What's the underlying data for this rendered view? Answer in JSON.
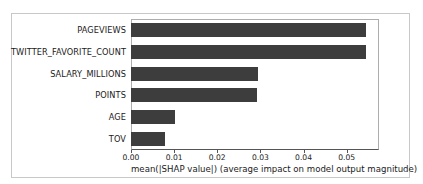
{
  "chart_data": {
    "type": "bar",
    "orientation": "horizontal",
    "title": "",
    "xlabel": "mean(|SHAP value|) (average impact on model output magnitude)",
    "ylabel": "",
    "categories": [
      "PAGEVIEWS",
      "TWITTER_FAVORITE_COUNT",
      "SALARY_MILLIONS",
      "POINTS",
      "AGE",
      "TOV"
    ],
    "values": [
      0.0545,
      0.0545,
      0.0294,
      0.0292,
      0.0103,
      0.0078
    ],
    "xlim": [
      0.0,
      0.0575
    ],
    "xticks": [
      0.0,
      0.01,
      0.02,
      0.03,
      0.04,
      0.05
    ],
    "xtick_labels": [
      "0.00",
      "0.01",
      "0.02",
      "0.03",
      "0.04",
      "0.05"
    ],
    "grid": false,
    "legend": null,
    "bar_color": "#3d3d3d",
    "background_color": "#ffffff",
    "axis_color": "#555555"
  }
}
